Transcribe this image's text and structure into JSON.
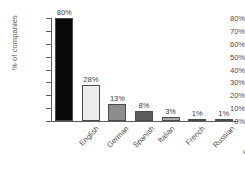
{
  "chart_data": {
    "type": "bar",
    "title": "",
    "xlabel": "",
    "ylabel": "% of companies",
    "ylim": [
      0,
      80
    ],
    "grid": false,
    "legend": null,
    "orientation": "vertical",
    "categories": [
      "English",
      "German",
      "Spanish",
      "Italian",
      "French",
      "Russian",
      "Portuguese"
    ],
    "values": [
      80,
      28,
      13,
      8,
      3,
      1,
      1
    ],
    "value_labels": [
      "80%",
      "28%",
      "13%",
      "8%",
      "3%",
      "1%",
      "1%"
    ],
    "bar_colors": [
      "#0a0a0a",
      "#ededed",
      "#8d8d8d",
      "#5c5c5c",
      "#a8a8a8",
      "#6b6b6b",
      "#b5b5b5"
    ],
    "bar_edge_color": "#4a4b4d",
    "y_ticks": [
      0,
      10,
      20,
      30,
      40,
      50,
      60,
      70,
      80
    ],
    "y_tick_labels": [
      "0%",
      "10%",
      "20%",
      "30%",
      "40%",
      "50%",
      "60%",
      "70%",
      "80%"
    ],
    "axis_color": "#5d5e60",
    "background": "#ffffff",
    "xtick_rotation": -45
  }
}
